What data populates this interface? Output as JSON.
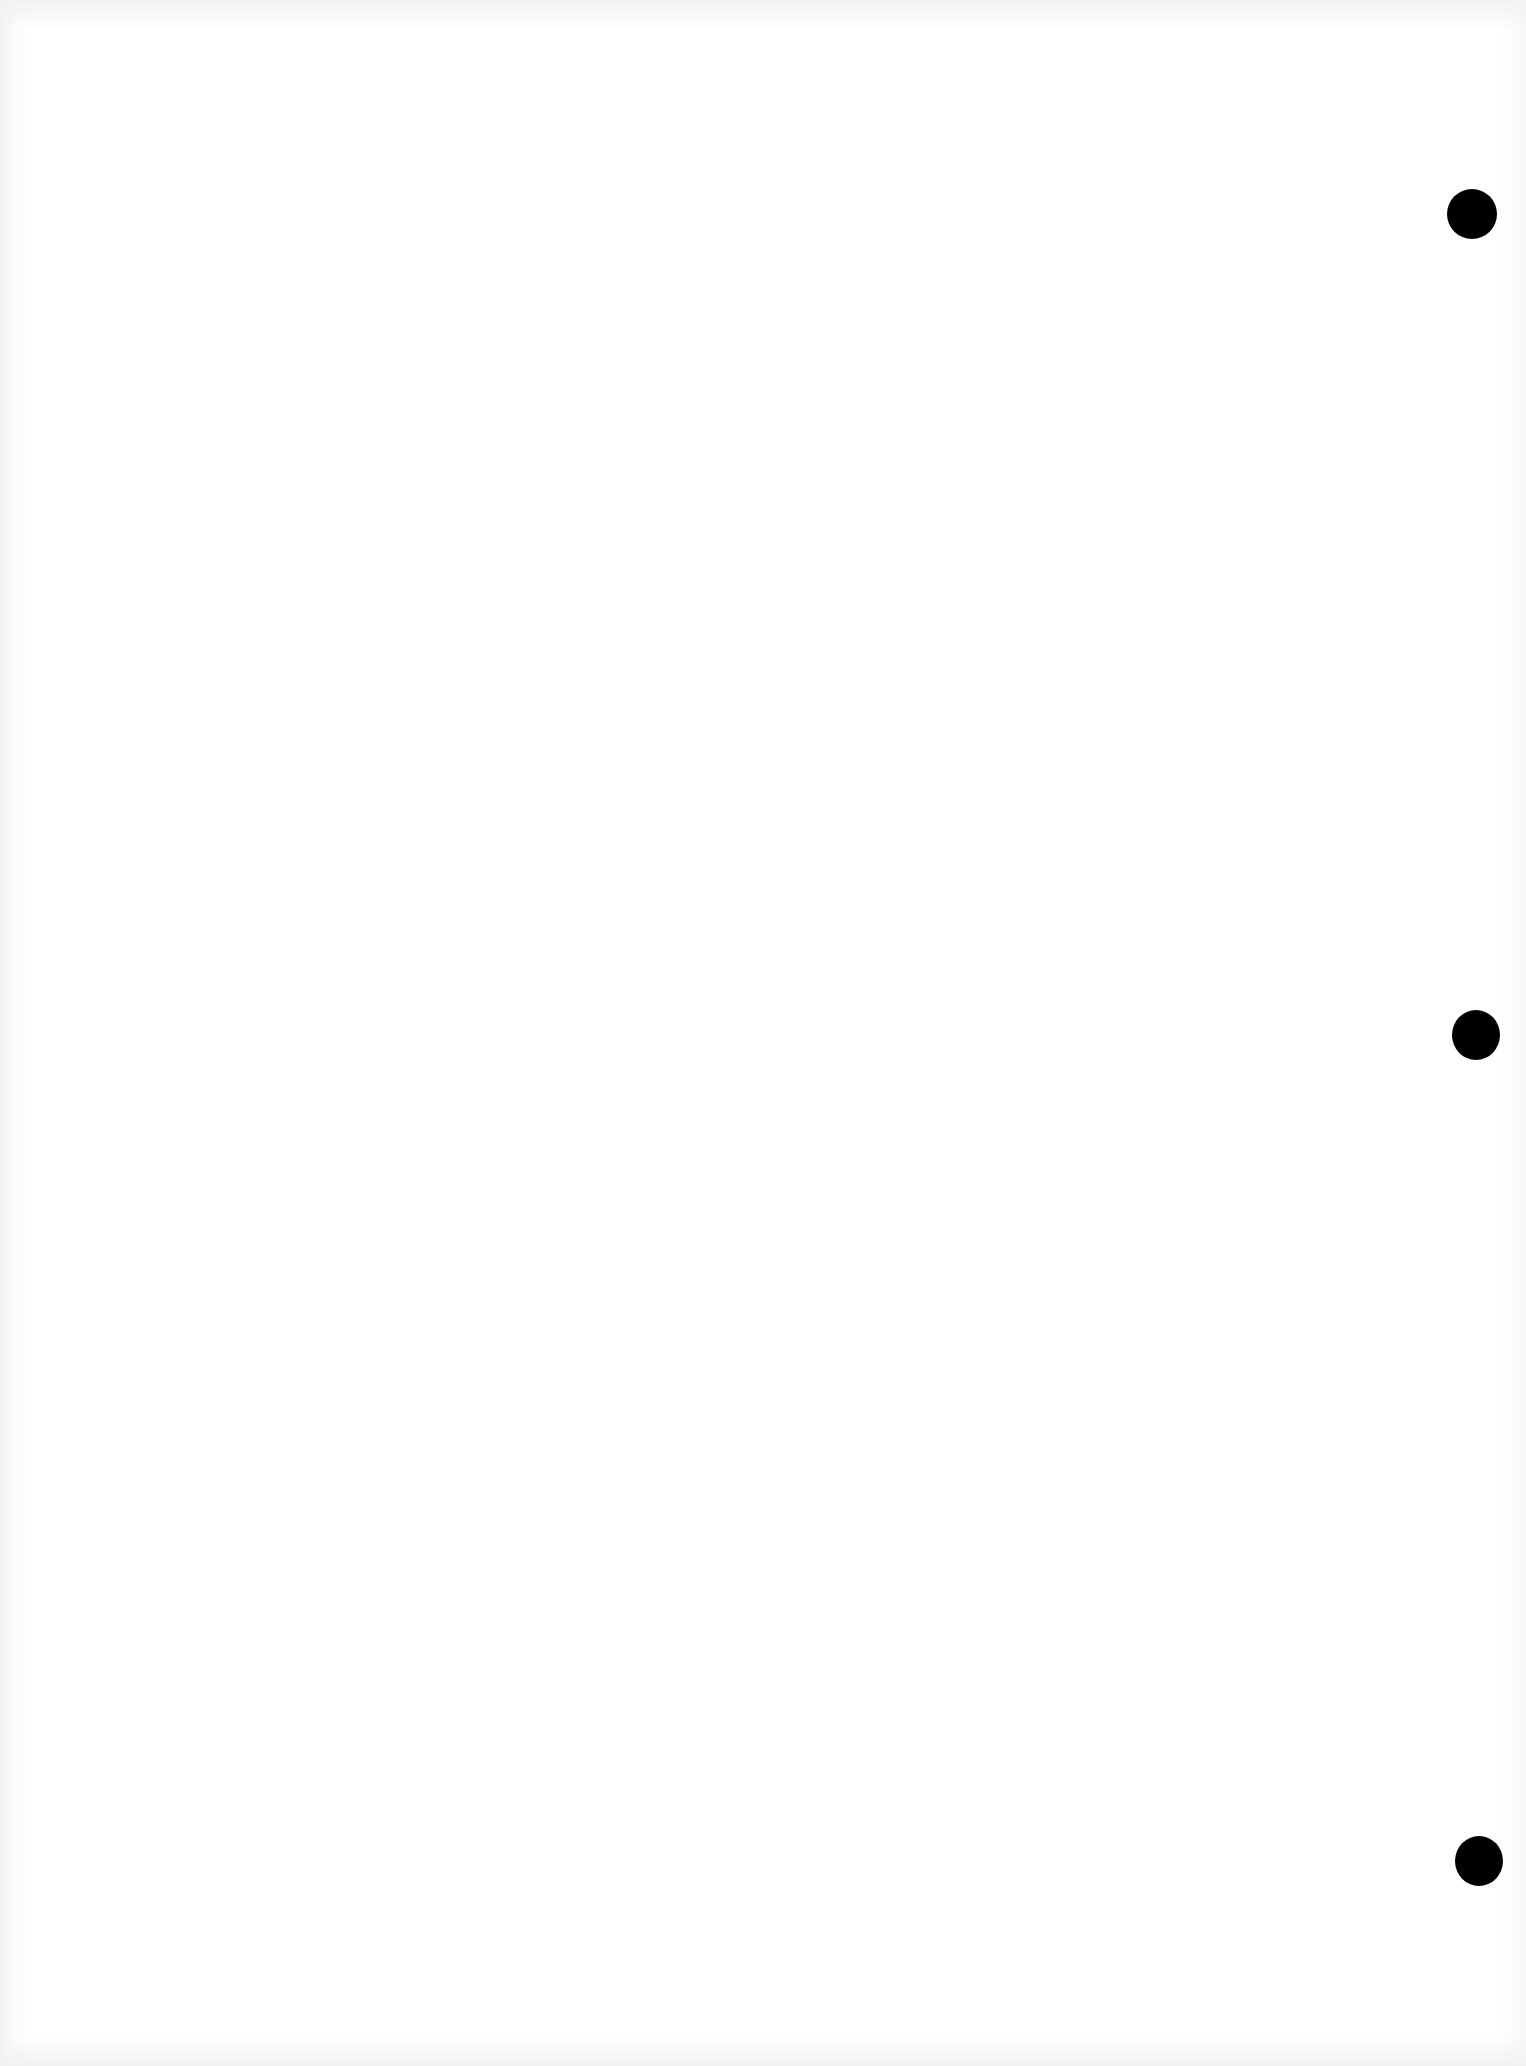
{
  "page": {
    "background_color": "#ffffff",
    "content_text": ""
  },
  "punch_holes": [
    {
      "cx": 1472,
      "cy": 214,
      "w": 50,
      "h": 50,
      "color": "#000000"
    },
    {
      "cx": 1476,
      "cy": 1035,
      "w": 48,
      "h": 50,
      "color": "#000000"
    },
    {
      "cx": 1479,
      "cy": 1861,
      "w": 48,
      "h": 50,
      "color": "#000000"
    }
  ]
}
